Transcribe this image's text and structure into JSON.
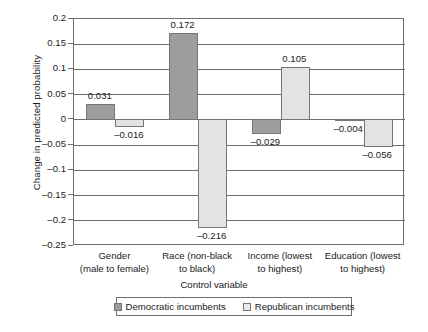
{
  "chart_data": {
    "type": "bar",
    "title": "",
    "xlabel": "Control variable",
    "ylabel": "Change in predicted probability",
    "ylim": [
      -0.25,
      0.2
    ],
    "ytick_step": 0.05,
    "grid": true,
    "legend_position": "bottom",
    "categories": [
      "Gender\n(male to female)",
      "Race (non-black\nto black)",
      "Income (lowest\nto highest)",
      "Education (lowest\nto highest)"
    ],
    "category_lines": [
      [
        "Gender",
        "(male to female)"
      ],
      [
        "Race (non-black",
        "to black)"
      ],
      [
        "Income (lowest",
        "to highest)"
      ],
      [
        "Education (lowest",
        "to highest)"
      ]
    ],
    "ytick_labels": [
      "0.2",
      "0.15",
      "0.1",
      "0.05",
      "0",
      "-0.05",
      "-0.1",
      "-0.15",
      "-0.2",
      "-0.25"
    ],
    "ytick_values": [
      0.2,
      0.15,
      0.1,
      0.05,
      0,
      -0.05,
      -0.1,
      -0.15,
      -0.2,
      -0.25
    ],
    "series": [
      {
        "name": "Democratic incumbents",
        "color": "#9d9d9d",
        "values": [
          0.031,
          0.172,
          -0.029,
          -0.004
        ],
        "labels": [
          "0.031",
          "0.172",
          "-0.029",
          "-0.004"
        ]
      },
      {
        "name": "Republican incumbents",
        "color": "#e3e3e3",
        "values": [
          -0.016,
          -0.216,
          0.105,
          -0.056
        ],
        "labels": [
          "-0.016",
          "-0.216",
          "0.105",
          "-0.056"
        ]
      }
    ]
  },
  "legend": {
    "entries": [
      {
        "label": "Democratic incumbents"
      },
      {
        "label": "Republican incumbents"
      }
    ]
  }
}
